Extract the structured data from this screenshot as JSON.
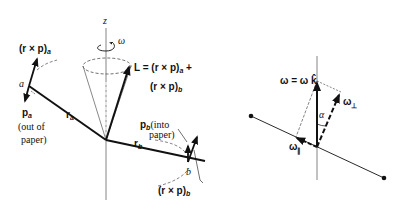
{
  "left_diagram": {
    "axis_label": "z",
    "rotation_label": "ω",
    "L_label_line1": "L = (r × p)",
    "L_sub_a": "a",
    "L_plus": " +",
    "L_label_line2": "(r × p)",
    "L_sub_b": "b",
    "rxp_a_label": "(r × p)",
    "rxp_a_sub": "a",
    "point_a": "a",
    "p_a_label": "p",
    "p_a_sub": "a",
    "p_a_note_1": "(out of",
    "p_a_note_2": "paper)",
    "r_a_label": "r",
    "r_a_sub": "a",
    "p_b_label": "p",
    "p_b_sub": "b",
    "p_b_note_1": "(into",
    "p_b_note_2": "paper)",
    "r_b_label": "r",
    "r_b_sub": "b",
    "point_b": "b",
    "rxp_b_label": "(r × p)",
    "rxp_b_sub": "b"
  },
  "right_diagram": {
    "omega_label": "ω = ω k̂",
    "omega_perp_label": "ω",
    "omega_perp_sub": "⊥",
    "omega_par_label": "ω",
    "omega_par_sub": "∥",
    "angle_label": "α"
  }
}
